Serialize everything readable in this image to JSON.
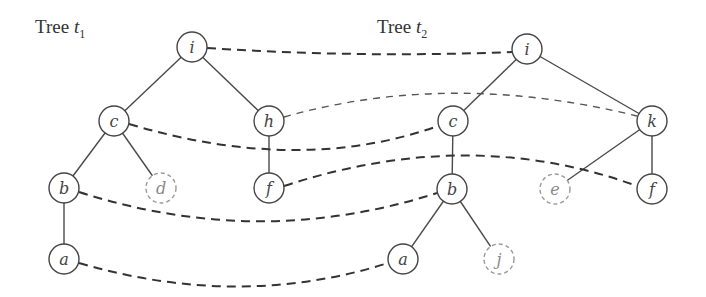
{
  "diagram": {
    "trees": [
      {
        "id": "t1",
        "title_prefix": "Tree ",
        "title_var": "t",
        "title_sub": "1",
        "title_pos": [
          35,
          16
        ],
        "nodes": [
          {
            "id": "t1-i",
            "label": "i",
            "x": 192,
            "y": 47,
            "dashed": false
          },
          {
            "id": "t1-c",
            "label": "c",
            "x": 114,
            "y": 121,
            "dashed": false
          },
          {
            "id": "t1-h",
            "label": "h",
            "x": 269,
            "y": 121,
            "dashed": false
          },
          {
            "id": "t1-b",
            "label": "b",
            "x": 64,
            "y": 188,
            "dashed": false
          },
          {
            "id": "t1-d",
            "label": "d",
            "x": 161,
            "y": 188,
            "dashed": true
          },
          {
            "id": "t1-f",
            "label": "f",
            "x": 269,
            "y": 188,
            "dashed": false
          },
          {
            "id": "t1-a",
            "label": "a",
            "x": 64,
            "y": 259,
            "dashed": false
          }
        ],
        "edges": [
          [
            "t1-i",
            "t1-c"
          ],
          [
            "t1-i",
            "t1-h"
          ],
          [
            "t1-c",
            "t1-b"
          ],
          [
            "t1-c",
            "t1-d"
          ],
          [
            "t1-h",
            "t1-f"
          ],
          [
            "t1-b",
            "t1-a"
          ]
        ]
      },
      {
        "id": "t2",
        "title_prefix": "Tree ",
        "title_var": "t",
        "title_sub": "2",
        "title_pos": [
          377,
          16
        ],
        "nodes": [
          {
            "id": "t2-i",
            "label": "i",
            "x": 527,
            "y": 49,
            "dashed": false
          },
          {
            "id": "t2-c",
            "label": "c",
            "x": 453,
            "y": 121,
            "dashed": false
          },
          {
            "id": "t2-k",
            "label": "k",
            "x": 652,
            "y": 121,
            "dashed": false
          },
          {
            "id": "t2-b",
            "label": "b",
            "x": 452,
            "y": 189,
            "dashed": false
          },
          {
            "id": "t2-e",
            "label": "e",
            "x": 555,
            "y": 189,
            "dashed": true
          },
          {
            "id": "t2-f",
            "label": "f",
            "x": 652,
            "y": 189,
            "dashed": false
          },
          {
            "id": "t2-a",
            "label": "a",
            "x": 403,
            "y": 259,
            "dashed": false
          },
          {
            "id": "t2-j",
            "label": "j",
            "x": 499,
            "y": 259,
            "dashed": true
          }
        ],
        "edges": [
          [
            "t2-i",
            "t2-c"
          ],
          [
            "t2-i",
            "t2-k"
          ],
          [
            "t2-c",
            "t2-b"
          ],
          [
            "t2-k",
            "t2-e"
          ],
          [
            "t2-k",
            "t2-f"
          ],
          [
            "t2-b",
            "t2-a"
          ],
          [
            "t2-b",
            "t2-j"
          ]
        ]
      }
    ],
    "node_radius": 15,
    "matchings": [
      {
        "from": "t1-i",
        "to": "t2-i",
        "path": "M207,48 Q360,58 512,52",
        "faint": false
      },
      {
        "from": "t1-h",
        "to": "t2-k",
        "path": "M284,117 Q450,70 637,116",
        "faint": true
      },
      {
        "from": "t1-c",
        "to": "t2-c",
        "path": "M129,124 Q300,175 438,126",
        "faint": false
      },
      {
        "from": "t1-f",
        "to": "t2-f",
        "path": "M284,186 Q470,125 637,186",
        "faint": false
      },
      {
        "from": "t1-b",
        "to": "t2-b",
        "path": "M79,192 Q260,250 437,193",
        "faint": false
      },
      {
        "from": "t1-a",
        "to": "t2-a",
        "path": "M79,263 Q240,310 388,263",
        "faint": false
      }
    ]
  }
}
